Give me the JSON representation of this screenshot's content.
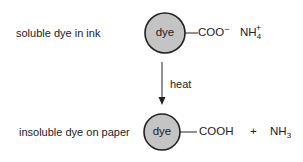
{
  "top_row": {
    "label": "soluble dye in ink",
    "dye_label": "dye",
    "group": "COO",
    "group_charge": "−",
    "counterion_base": "NH",
    "counterion_sub": "4",
    "counterion_charge": "+"
  },
  "arrow": {
    "label": "heat"
  },
  "bottom_row": {
    "label": "insoluble dye on paper",
    "dye_label": "dye",
    "group": "COOH",
    "plus": "+",
    "product_base": "NH",
    "product_sub": "3"
  },
  "colors": {
    "circle_fill": "#c4c4c4",
    "stroke": "#222222"
  }
}
